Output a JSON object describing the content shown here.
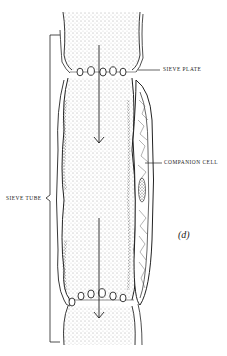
{
  "figure": {
    "panel_label": "(d)",
    "labels": {
      "sieve_plate": "SIEVE PLATE",
      "companion_cell": "COMPANION CELL",
      "sieve_tube": "SIEVE TUBE"
    },
    "colors": {
      "ink": "#222222",
      "stipple": "#555555",
      "background": "#ffffff"
    },
    "flow_direction": "downward"
  }
}
